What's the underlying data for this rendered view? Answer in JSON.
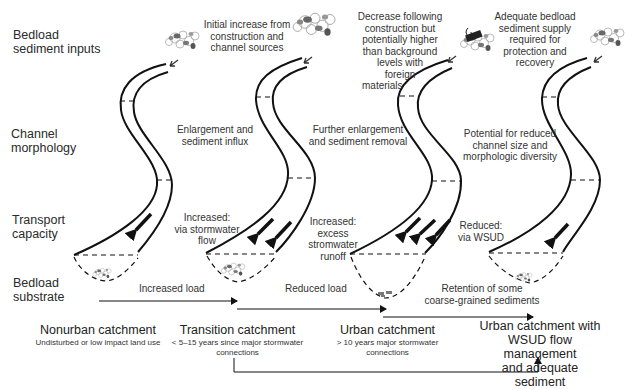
{
  "row_labels": {
    "inputs": [
      "Bedload",
      "sediment inputs"
    ],
    "morphology": [
      "Channel",
      "morphology"
    ],
    "transport": [
      "Transport",
      "capacity"
    ],
    "substrate": [
      "Bedload",
      "substrate"
    ]
  },
  "stages": [
    {
      "id": "nonurban",
      "title": "Nonurban catchment",
      "subtitle": "Undisturbed or low impact land use",
      "input_note": "",
      "morphology_note": "",
      "transport_note": "",
      "transport_arrows": 1
    },
    {
      "id": "transition",
      "title": "Transition catchment",
      "subtitle": "< 5–15 years since major stormwater connections",
      "input_note": "Initial increase from construction and channel sources",
      "morphology_note": "Enlargement and sediment influx",
      "transport_note": "Increased: via stormwater flow",
      "transport_arrows": 2
    },
    {
      "id": "urban",
      "title": "Urban catchment",
      "subtitle": "> 10 years major stormwater connections",
      "input_note": "Decrease following construction but potentially higher than background levels with foreign materials",
      "morphology_note": "Further enlargement and sediment removal",
      "transport_note": "Increased: excess stromwater runoff",
      "transport_arrows": 3
    },
    {
      "id": "wsud",
      "title": "Urban catchment with WSUD flow management and adequate sediment",
      "subtitle": "",
      "input_note": "Adequate bedload sediment supply required for protection and recovery",
      "morphology_note": "Potential for reduced channel size and morphologic diversity",
      "transport_note": "Reduced: via WSUD",
      "transport_arrows": 1
    }
  ],
  "flows": [
    {
      "label": "Increased load",
      "from": "nonurban",
      "to": "transition"
    },
    {
      "label": "Reduced load",
      "from": "transition",
      "to": "urban"
    },
    {
      "label": "Retention of some coarse-grained sediments",
      "from": "urban",
      "to": "wsud"
    },
    {
      "label": "",
      "from": "transition",
      "to": "wsud"
    }
  ],
  "text": {
    "t1_input": [
      "Initial increase from",
      "construction and",
      "channel sources"
    ],
    "t2_input": [
      "Decrease following",
      "construction but",
      "potentially higher",
      "than background",
      "levels with",
      "foreign",
      "materials"
    ],
    "t3_input": [
      "Adequate bedload",
      "sediment supply",
      "required for",
      "protection and",
      "recovery"
    ],
    "t1_morph": [
      "Enlargement and",
      "sediment influx"
    ],
    "t2_morph": [
      "Further enlargement",
      "and sediment removal"
    ],
    "t3_morph": [
      "Potential for reduced",
      "channel size and",
      "morphologic diversity"
    ],
    "t1_trans": [
      "Increased:",
      "via stormwater",
      "flow"
    ],
    "t2_trans": [
      "Increased:",
      "excess",
      "stromwater",
      "runoff"
    ],
    "t3_trans": [
      "Reduced:",
      "via WSUD"
    ],
    "flow1": "Increased load",
    "flow2": "Reduced load",
    "flow3": [
      "Retention of some",
      "coarse-grained sediments"
    ],
    "cat0_title": "Nonurban catchment",
    "cat0_sub": "Undisturbed or low impact land use",
    "cat1_title": "Transition catchment",
    "cat1_sub": [
      "< 5–15 years since major stormwater",
      "connections"
    ],
    "cat2_title": "Urban catchment",
    "cat2_sub": [
      "> 10 years major stormwater",
      "connections"
    ],
    "cat3_title": [
      "Urban catchment with",
      "WSUD flow management",
      "and adequate sediment"
    ]
  },
  "colors": {
    "line": "#111111",
    "text": "#2a2a2a",
    "sediment_dark": "#5a5a5a",
    "sediment_light": "#bdbdbd",
    "background": "#ffffff"
  }
}
